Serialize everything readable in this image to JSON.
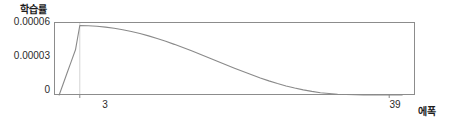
{
  "chart_data": {
    "type": "line",
    "title": "",
    "ylabel": "학습률",
    "xlabel": "에폭",
    "grid": false,
    "legend": null,
    "xlim": [
      0,
      42
    ],
    "ylim": [
      0,
      6.3e-05
    ],
    "x_ticks": [
      3,
      39
    ],
    "x_tick_labels": [
      "3",
      "39"
    ],
    "y_ticks": [
      0,
      3e-05,
      6e-05
    ],
    "y_tick_labels": [
      "0",
      "0.00003",
      "0.00006"
    ],
    "annotations": [
      {
        "name": "warmup-guide-line",
        "x": 3,
        "description": "vertical guide line at peak of warmup"
      }
    ],
    "series": [
      {
        "name": "learning-rate-schedule",
        "color": "#8a8a8a",
        "x": [
          0.6,
          1,
          1.5,
          2,
          2.5,
          3,
          4,
          5,
          6,
          7,
          8,
          9,
          10,
          11,
          12,
          13,
          14,
          15,
          16,
          17,
          18,
          19,
          20,
          21,
          22,
          23,
          24,
          25,
          26,
          27,
          28,
          29,
          30,
          31,
          32,
          33,
          34,
          35,
          36,
          37,
          38,
          39,
          40.5
        ],
        "y": [
          0.0,
          8.2e-06,
          1.85e-05,
          2.88e-05,
          3.9e-05,
          6e-05,
          5.98e-05,
          5.93e-05,
          5.86e-05,
          5.76e-05,
          5.63e-05,
          5.48e-05,
          5.3e-05,
          5.1e-05,
          4.87e-05,
          4.63e-05,
          4.37e-05,
          4.09e-05,
          3.81e-05,
          3.51e-05,
          3.21e-05,
          2.91e-05,
          2.61e-05,
          2.31e-05,
          2.02e-05,
          1.74e-05,
          1.47e-05,
          1.22e-05,
          9.9e-06,
          7.8e-06,
          6e-06,
          4.4e-06,
          3.1e-06,
          2e-06,
          1.3e-06,
          7e-07,
          4e-07,
          2e-07,
          1e-07,
          1e-07,
          0.0,
          0.0,
          0.0
        ]
      }
    ]
  },
  "axis": {
    "y_title": "학습률",
    "x_title": "에폭",
    "y_tick_labels": [
      "0.00006",
      "0.00003",
      "0"
    ],
    "x_tick_labels": [
      "3",
      "39"
    ]
  },
  "colors": {
    "curve": "#8a8a8a",
    "frame": "#8c8c8c",
    "guide": "#c8c8c8",
    "text": "#2b2b2b"
  }
}
